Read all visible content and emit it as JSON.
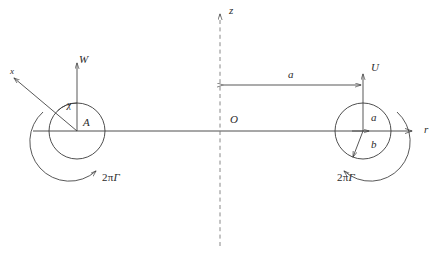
{
  "figure": {
    "background_color": "#ffffff",
    "line_color": "#3a3a3a",
    "text_color": "#2b2b2b",
    "width": 439,
    "height": 258
  },
  "axes": {
    "radial": {
      "label": "r",
      "label_x": 424,
      "label_y": 124,
      "y": 131,
      "x_start": 33,
      "x_end": 412
    },
    "vertical": {
      "label": "z",
      "label_x": 229,
      "label_y": 5,
      "x": 220,
      "y_start": 14,
      "y_end": 246,
      "style": "dashed"
    },
    "origin": {
      "label": "O",
      "label_x": 230,
      "label_y": 114
    }
  },
  "dimension": {
    "label": "a",
    "label_x": 288,
    "label_y": 69,
    "y": 85,
    "x_start": 221,
    "x_end": 363,
    "arrows": "both"
  },
  "left_vortex": {
    "name": "image-vortex",
    "center_x": 77,
    "center_y": 131,
    "radius": 28,
    "velocity_label": "W",
    "velocity_label_x": 79,
    "velocity_label_y": 54,
    "angle_label": "χ",
    "angle_label_x": 67,
    "angle_label_y": 100,
    "point_label": "A",
    "point_label_x": 83,
    "point_label_y": 117,
    "oblique_label": "x",
    "oblique_label_x": 10,
    "oblique_label_y": 67,
    "circulation_label_prefix": "2π",
    "circulation_label_symbol": "Γ",
    "circulation_label_x": 102,
    "circulation_label_y": 172,
    "circulation_direction": "clockwise-arrow-at-lower-right"
  },
  "right_vortex": {
    "name": "primary-vortex",
    "center_x": 363,
    "center_y": 131,
    "radius": 28,
    "velocity_label": "U",
    "velocity_label_x": 371,
    "velocity_label_y": 62,
    "outer_radius_label": "a",
    "outer_radius_label_x": 371,
    "outer_radius_label_y": 112,
    "core_radius_label": "b",
    "core_radius_label_x": 371,
    "core_radius_label_y": 139,
    "circulation_label_prefix": "2π",
    "circulation_label_symbol": "Γ",
    "circulation_label_x": 337,
    "circulation_label_y": 172,
    "circulation_direction": "counterclockwise-arrow-at-lower-left"
  }
}
